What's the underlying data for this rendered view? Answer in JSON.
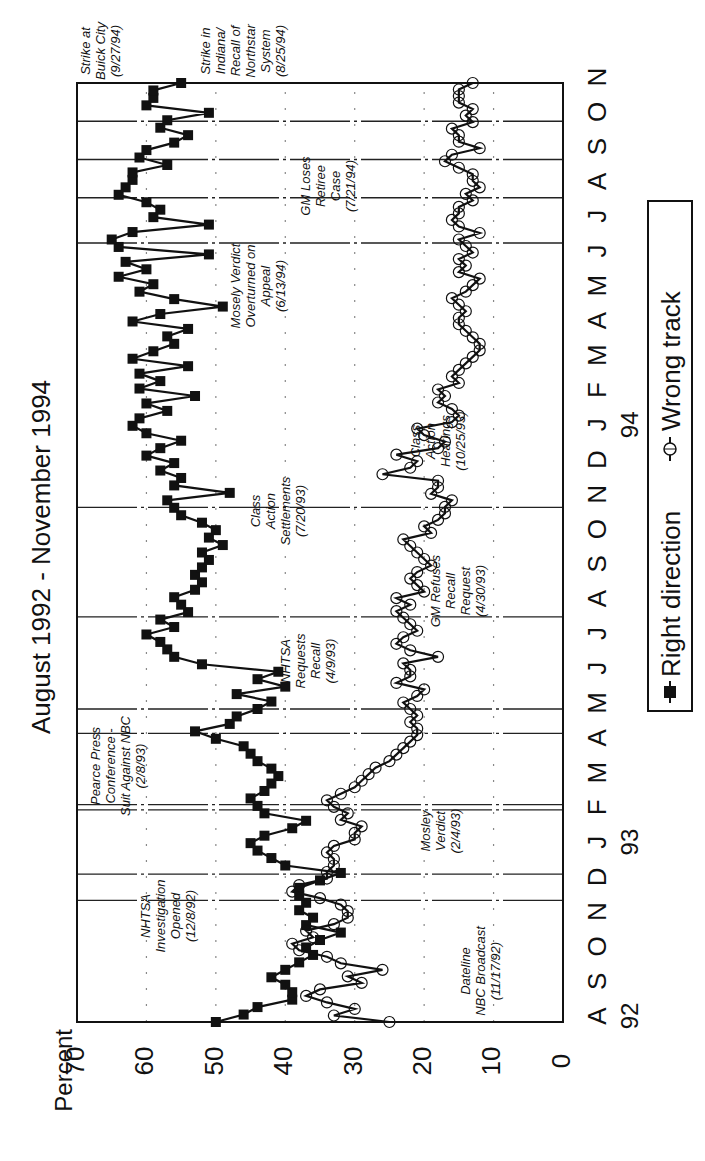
{
  "chart_data": {
    "type": "line",
    "title": "August 1992 - November 1994",
    "ylabel": "Percent",
    "xlabel": "",
    "ylim": [
      0,
      70
    ],
    "yticks": [
      0,
      10,
      20,
      30,
      40,
      50,
      60,
      70
    ],
    "months": [
      "A",
      "S",
      "O",
      "N",
      "D",
      "J",
      "F",
      "M",
      "A",
      "M",
      "J",
      "J",
      "A",
      "S",
      "O",
      "N",
      "D",
      "J",
      "F",
      "M",
      "A",
      "M",
      "J",
      "J",
      "A",
      "S",
      "O",
      "N"
    ],
    "years": [
      {
        "label": "92",
        "month_index": 0
      },
      {
        "label": "93",
        "month_index": 5
      },
      {
        "label": "94",
        "month_index": 17
      }
    ],
    "x_start": "Aug 1992",
    "x_end": "Nov 1994",
    "legend_position": "bottom",
    "series": [
      {
        "name": "Right direction",
        "marker": "filled-square",
        "values": [
          50,
          46,
          44,
          39,
          39,
          40,
          42,
          40,
          38,
          36,
          37,
          35,
          32,
          37,
          36,
          38,
          37,
          38,
          38,
          35,
          32,
          40,
          42,
          44,
          45,
          43,
          39,
          37,
          43,
          44,
          45,
          43,
          42,
          41,
          42,
          44,
          45,
          46,
          50,
          53,
          48,
          47,
          44,
          42,
          47,
          40,
          44,
          41,
          52,
          56,
          57,
          58,
          60,
          56,
          58,
          54,
          55,
          56,
          53,
          52,
          53,
          52,
          51,
          52,
          49,
          51,
          50,
          52,
          55,
          56,
          57,
          48,
          56,
          55,
          58,
          56,
          60,
          58,
          55,
          60,
          62,
          61,
          57,
          60,
          53,
          61,
          58,
          61,
          54,
          62,
          59,
          56,
          57,
          54,
          62,
          58,
          49,
          56,
          61,
          59,
          64,
          60,
          63,
          51,
          64,
          65,
          62,
          51,
          59,
          58,
          60,
          64,
          63,
          62,
          62,
          57,
          61,
          60,
          56,
          54,
          58,
          57,
          51,
          60,
          59,
          59,
          55
        ]
      },
      {
        "name": "Wrong track",
        "marker": "open-circle",
        "values": [
          25,
          33,
          30,
          34,
          37,
          35,
          29,
          31,
          26,
          32,
          34,
          38,
          39,
          36,
          37,
          33,
          31,
          31,
          32,
          35,
          39,
          38,
          34,
          34,
          33,
          33,
          34,
          33,
          30,
          30,
          29,
          32,
          31,
          33,
          34,
          32,
          30,
          29,
          28,
          27,
          25,
          24,
          23,
          22,
          21,
          21,
          22,
          21,
          22,
          23,
          21,
          20,
          24,
          22,
          22,
          23,
          18,
          22,
          24,
          23,
          21,
          22,
          23,
          24,
          22,
          24,
          20,
          21,
          22,
          21,
          19,
          20,
          21,
          22,
          23,
          19,
          20,
          18,
          17,
          17,
          16,
          19,
          18,
          18,
          26,
          22,
          21,
          24,
          18,
          17,
          20,
          21,
          16,
          15,
          16,
          18,
          17,
          18,
          15,
          16,
          15,
          14,
          13,
          12,
          12,
          13,
          14,
          15,
          15,
          14,
          15,
          16,
          14,
          13,
          12,
          15,
          14,
          15,
          13,
          14,
          15,
          12,
          15,
          16,
          15,
          15,
          13,
          14,
          12,
          13,
          13,
          15,
          17,
          16,
          12,
          15,
          15,
          16,
          13,
          14,
          13,
          15,
          15,
          15,
          13
        ]
      }
    ],
    "annotations": [
      {
        "id": "dateline",
        "lines": [
          "Dateline",
          "NBC Broadcast",
          "(11/17/92)"
        ]
      },
      {
        "id": "nhtsa-investigation",
        "lines": [
          "NHTSA",
          "Investigation",
          "Opened",
          "(12/8/92)"
        ]
      },
      {
        "id": "mosley-verdict",
        "lines": [
          "Mosley",
          "Verdict",
          "(2/4/93)"
        ]
      },
      {
        "id": "pearce-press",
        "lines": [
          "Pearce Press",
          "Conference -",
          "Suit Against NBC",
          "(2/8/93)"
        ]
      },
      {
        "id": "nhtsa-requests",
        "lines": [
          "NHTSA",
          "Requests",
          "Recall",
          "(4/9/93)"
        ]
      },
      {
        "id": "gm-refuses",
        "lines": [
          "GM Refuses",
          "Recall",
          "Request",
          "(4/30/93)"
        ]
      },
      {
        "id": "class-action-settlements",
        "lines": [
          "Class",
          "Action",
          "Settlements",
          "(7/20/93)"
        ]
      },
      {
        "id": "class-action-hearings",
        "lines": [
          "Class",
          "Action",
          "Hearings",
          "(10/25/93)"
        ]
      },
      {
        "id": "mosely-overturned",
        "lines": [
          "Mosely Verdict",
          "Overturned on",
          "Appeal",
          "(6/13/94)"
        ]
      },
      {
        "id": "gm-loses-retiree",
        "lines": [
          "GM Loses",
          "Retiree",
          "Case",
          "(7/21/94)"
        ]
      },
      {
        "id": "strike-indiana",
        "lines": [
          "Strike in",
          "Indiana/",
          "Recall of",
          "Northstar",
          "System",
          "(8/25/94)"
        ]
      },
      {
        "id": "strike-buick",
        "lines": [
          "Strike at",
          "Buick City",
          "(9/27/94)"
        ]
      }
    ]
  },
  "legend": {
    "right_direction": "Right direction",
    "wrong_track": "Wrong track"
  }
}
